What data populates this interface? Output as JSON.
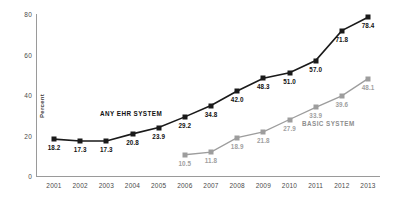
{
  "chart_data": {
    "type": "line",
    "title": "",
    "xlabel": "",
    "ylabel": "Percent",
    "ylim": [
      0,
      80
    ],
    "yticks": [
      0,
      20,
      40,
      60,
      80
    ],
    "grid": false,
    "legend_position": "inline-annotation",
    "categories": [
      "2001",
      "2002",
      "2003",
      "2004",
      "2005",
      "2006",
      "2007",
      "2008",
      "2009",
      "2010",
      "2011",
      "2012",
      "2013"
    ],
    "series": [
      {
        "name": "ANY EHR SYSTEM",
        "color": "#1a1a1a",
        "values": [
          18.2,
          17.3,
          17.3,
          20.8,
          23.9,
          29.2,
          34.8,
          42.0,
          48.3,
          51.0,
          57.0,
          71.8,
          78.4
        ],
        "labels": [
          "18.2",
          "17.3",
          "17.3",
          "20.8",
          "23.9",
          "29.2",
          "34.8",
          "42.0",
          "48.3",
          "51.0",
          "57.0",
          "71.8",
          "78.4"
        ]
      },
      {
        "name": "BASIC SYSTEM",
        "color": "#9d9d9d",
        "values": [
          null,
          null,
          null,
          null,
          null,
          10.5,
          11.8,
          18.9,
          21.8,
          27.9,
          33.9,
          39.6,
          48.1
        ],
        "labels": [
          "",
          "",
          "",
          "",
          "",
          "10.5",
          "11.8",
          "18.9",
          "21.8",
          "27.9",
          "33.9",
          "39.6",
          "48.1"
        ]
      }
    ],
    "annotations": [
      {
        "text": "ANY EHR SYSTEM",
        "series": "ANY EHR SYSTEM"
      },
      {
        "text": "BASIC SYSTEM",
        "series": "BASIC SYSTEM"
      }
    ]
  }
}
